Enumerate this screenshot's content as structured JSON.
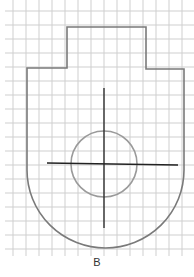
{
  "diagram": {
    "label": "B",
    "grid": {
      "step": 13.3,
      "color": "#cccccc"
    },
    "outline": {
      "color": "#777777"
    },
    "circle": {
      "color": "#999999"
    },
    "crosshair": {
      "color": "#222222"
    }
  }
}
